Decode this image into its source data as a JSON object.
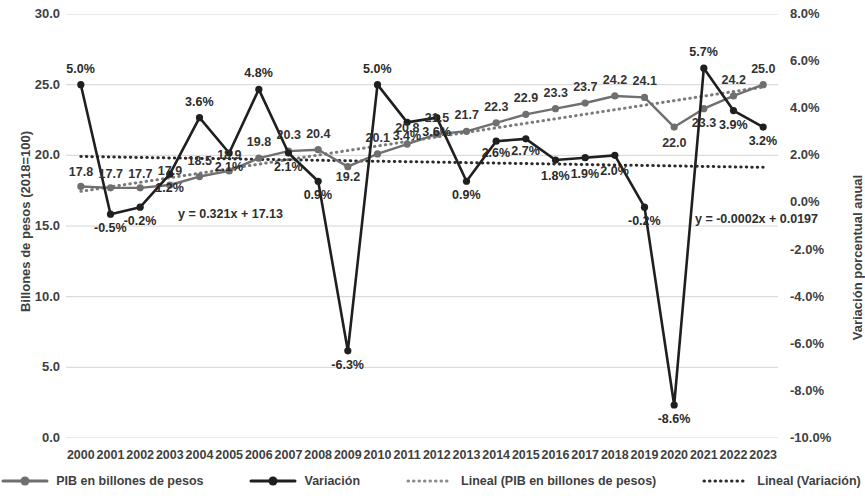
{
  "chart_data": {
    "type": "line",
    "title": "",
    "xlabel": "",
    "ylabel": "Billones de pesos (2018=100)",
    "y2label": "Variación porcentual anual",
    "grid": true,
    "legend_position": "bottom",
    "categories": [
      "2000",
      "2001",
      "2002",
      "2003",
      "2004",
      "2005",
      "2006",
      "2007",
      "2008",
      "2009",
      "2010",
      "2011",
      "2012",
      "2013",
      "2014",
      "2015",
      "2016",
      "2017",
      "2018",
      "2019",
      "2020",
      "2021",
      "2022",
      "2023"
    ],
    "ylim": [
      0,
      30
    ],
    "y2lim": [
      -10,
      8
    ],
    "yticks": [
      "0.0",
      "5.0",
      "10.0",
      "15.0",
      "20.0",
      "25.0",
      "30.0"
    ],
    "y2ticks": [
      "-10.0%",
      "-8.0%",
      "-6.0%",
      "-4.0%",
      "-2.0%",
      "0.0%",
      "2.0%",
      "4.0%",
      "6.0%",
      "8.0%"
    ],
    "series": [
      {
        "name": "PIB en billones de pesos",
        "axis": "left",
        "color": "#6f6f6f",
        "values": [
          17.8,
          17.7,
          17.7,
          17.9,
          18.5,
          18.9,
          19.8,
          20.3,
          20.4,
          19.2,
          20.1,
          20.8,
          21.5,
          21.7,
          22.3,
          22.9,
          23.3,
          23.7,
          24.2,
          24.1,
          22.0,
          23.3,
          24.2,
          25.0
        ],
        "labels": [
          "17.8",
          "17.7",
          "17.7",
          "17.9",
          "18.5",
          "18.9",
          "19.8",
          "20.3",
          "20.4",
          "19.2",
          "20.1",
          "20.8",
          "21.5",
          "21.7",
          "22.3",
          "22.9",
          "23.3",
          "23.7",
          "24.2",
          "24.1",
          "22.0",
          "23.3",
          "24.2",
          "25.0"
        ]
      },
      {
        "name": "Variación",
        "axis": "right",
        "color": "#1f1f1f",
        "values": [
          5.0,
          -0.5,
          -0.2,
          1.2,
          3.6,
          2.1,
          4.8,
          2.1,
          0.9,
          -6.3,
          5.0,
          3.4,
          3.6,
          0.9,
          2.6,
          2.7,
          1.8,
          1.9,
          2.0,
          -0.2,
          -8.6,
          5.7,
          3.9,
          3.2
        ],
        "labels": [
          "5.0%",
          "-0.5%",
          "-0.2%",
          "1.2%",
          "3.6%",
          "2.1%",
          "4.8%",
          "2.1%",
          "0.9%",
          "-6.3%",
          "5.0%",
          "3.4%",
          "3.6%",
          "0.9%",
          "2.6%",
          "2.7%",
          "1.8%",
          "1.9%",
          "2.0%",
          "-0.2%",
          "-8.6%",
          "5.7%",
          "3.9%",
          "3.2%"
        ]
      }
    ],
    "trendlines": [
      {
        "name": "Lineal (PIB en billones de pesos)",
        "axis": "left",
        "color": "#7a7a7a",
        "equation": "y = 0.321x + 17.13",
        "slope": 0.321,
        "intercept": 17.13
      },
      {
        "name": "Lineal (Variación)",
        "axis": "right",
        "color": "#2b2b2b",
        "equation": "y = -0.0002x + 0.0197",
        "slope": -0.02,
        "intercept": 1.97
      }
    ],
    "legend": [
      {
        "label": "PIB en billones de pesos",
        "style": "solid-marker",
        "color": "#6f6f6f"
      },
      {
        "label": "Variación",
        "style": "solid-marker",
        "color": "#1f1f1f"
      },
      {
        "label": "Lineal (PIB en billones de pesos)",
        "style": "dotted",
        "color": "#8a8a8a"
      },
      {
        "label": "Lineal (Variación)",
        "style": "dotted",
        "color": "#2b2b2b"
      }
    ]
  }
}
